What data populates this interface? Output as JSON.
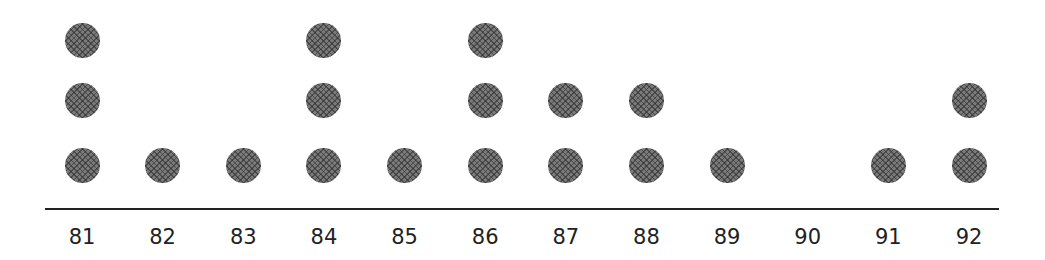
{
  "chart_data": {
    "type": "scatter",
    "subtype": "dot_plot",
    "title": "",
    "xlabel": "",
    "ylabel": "",
    "categories": [
      "81",
      "82",
      "83",
      "84",
      "85",
      "86",
      "87",
      "88",
      "89",
      "90",
      "91",
      "92"
    ],
    "values": [
      3,
      1,
      1,
      3,
      1,
      3,
      2,
      2,
      1,
      0,
      1,
      2
    ],
    "grid": false,
    "legend": null,
    "dot_color": "#7a7a7a",
    "axis_color": "#222222"
  }
}
